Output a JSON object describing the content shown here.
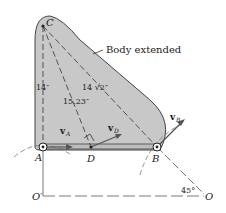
{
  "figure": {
    "body_label": "Body extended",
    "points": {
      "C": "C",
      "A": "A",
      "B": "B",
      "D": "D",
      "O_prime": "O′",
      "O": "O"
    },
    "dimensions": {
      "CA": "14″",
      "CB": "14 √2″",
      "CD": "15.23″"
    },
    "velocities": {
      "vA": "v",
      "vA_sub": "A",
      "vD": "v",
      "vD_sub": "D",
      "vB": "v",
      "vB_sub": "B"
    },
    "angle": "45°",
    "colors": {
      "body_fill": "#c8c8c8",
      "line": "#333333",
      "background": "#ffffff"
    }
  }
}
